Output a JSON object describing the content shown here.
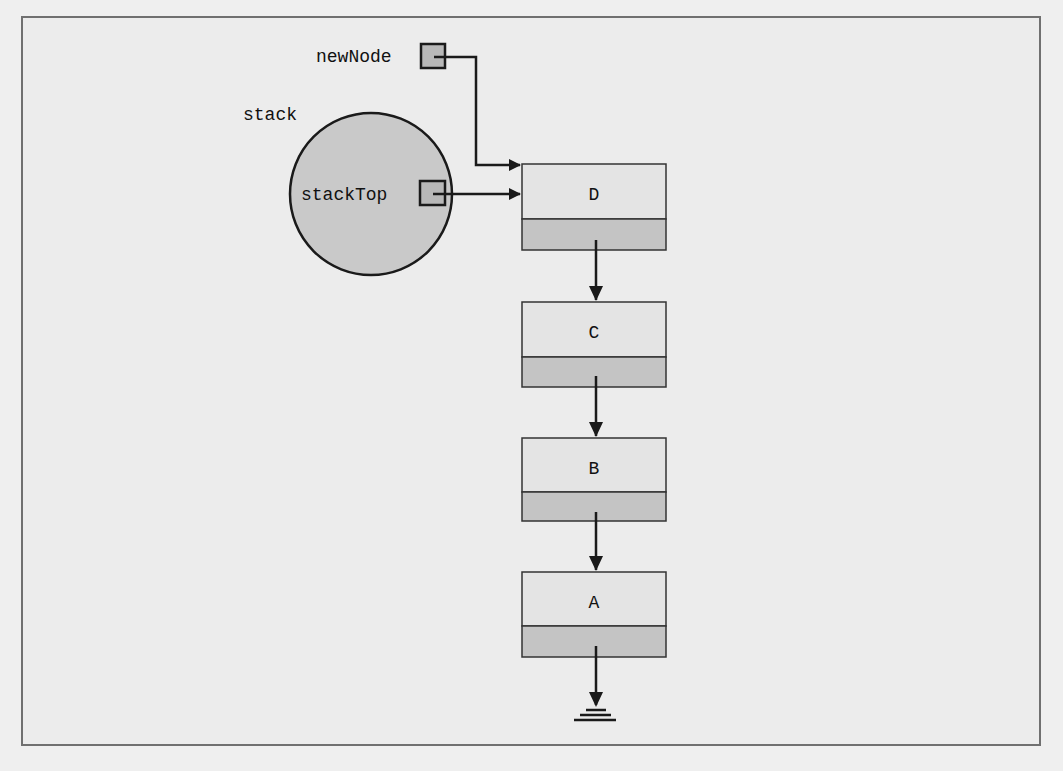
{
  "diagram": {
    "labels": {
      "new_node": "newNode",
      "stack": "stack",
      "stack_top": "stackTop"
    },
    "nodes": [
      {
        "id": "D",
        "label": "D"
      },
      {
        "id": "C",
        "label": "C"
      },
      {
        "id": "B",
        "label": "B"
      },
      {
        "id": "A",
        "label": "A"
      }
    ],
    "terminator": "null-ground-icon",
    "colors": {
      "background": "#ececec",
      "frame_border": "#707070",
      "circle_fill": "#c9c9c9",
      "node_data_fill": "#e4e4e4",
      "node_link_fill": "#c4c4c4",
      "pointer_box_fill": "#b8b8b8",
      "stroke": "#1a1a1a"
    }
  }
}
